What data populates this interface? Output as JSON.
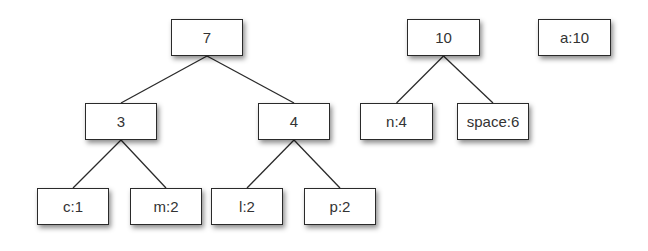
{
  "diagram": {
    "type": "huffman-tree-forest",
    "nodes": [
      {
        "id": "n7",
        "label": "7",
        "x": 171,
        "y": 19,
        "w": 72,
        "h": 37
      },
      {
        "id": "n3",
        "label": "3",
        "x": 85,
        "y": 103,
        "w": 72,
        "h": 37
      },
      {
        "id": "n4",
        "label": "4",
        "x": 258,
        "y": 103,
        "w": 72,
        "h": 37
      },
      {
        "id": "c1",
        "label": "c:1",
        "x": 37,
        "y": 188,
        "w": 72,
        "h": 37
      },
      {
        "id": "m2",
        "label": "m:2",
        "x": 130,
        "y": 188,
        "w": 72,
        "h": 37
      },
      {
        "id": "l2",
        "label": "l:2",
        "x": 211,
        "y": 188,
        "w": 72,
        "h": 37
      },
      {
        "id": "p2",
        "label": "p:2",
        "x": 304,
        "y": 188,
        "w": 72,
        "h": 37
      },
      {
        "id": "n10",
        "label": "10",
        "x": 407,
        "y": 19,
        "w": 73,
        "h": 37
      },
      {
        "id": "n4b",
        "label": "n:4",
        "x": 360,
        "y": 103,
        "w": 73,
        "h": 37
      },
      {
        "id": "sp6",
        "label": "space:6",
        "x": 457,
        "y": 103,
        "w": 72,
        "h": 37
      },
      {
        "id": "a10",
        "label": "a:10",
        "x": 538,
        "y": 19,
        "w": 73,
        "h": 37
      }
    ],
    "edges": [
      {
        "from": "n7",
        "to": "n3"
      },
      {
        "from": "n7",
        "to": "n4"
      },
      {
        "from": "n3",
        "to": "c1"
      },
      {
        "from": "n3",
        "to": "m2"
      },
      {
        "from": "n4",
        "to": "l2"
      },
      {
        "from": "n4",
        "to": "p2"
      },
      {
        "from": "n10",
        "to": "n4b"
      },
      {
        "from": "n10",
        "to": "sp6"
      }
    ]
  }
}
